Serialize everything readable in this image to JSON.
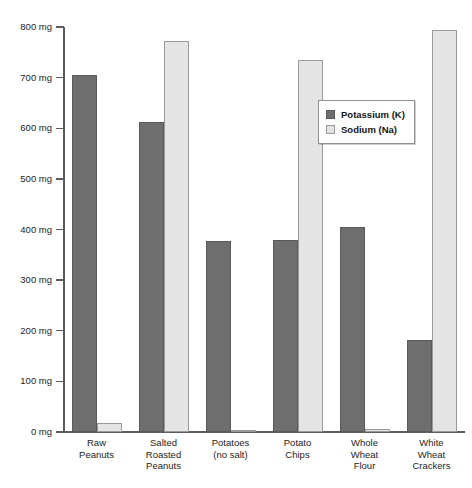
{
  "chart_data": {
    "type": "bar",
    "title": "Potassium and Sodium Content of Selected Foods",
    "xlabel": "",
    "ylabel": "",
    "ylim": [
      0,
      800
    ],
    "y_tick_step": 100,
    "y_unit": "mg",
    "grid": false,
    "legend_position": "inside upper-right",
    "categories": [
      "Raw Peanuts",
      "Salted Roasted Peanuts",
      "Potatoes (no salt)",
      "Potato Chips",
      "Whole Wheat Flour",
      "White Wheat Crackers"
    ],
    "category_label_lines": [
      [
        "Raw",
        "Peanuts"
      ],
      [
        "Salted",
        "Roasted",
        "Peanuts"
      ],
      [
        "Potatoes",
        "(no salt)"
      ],
      [
        "Potato",
        "Chips"
      ],
      [
        "Whole",
        "Wheat",
        "Flour"
      ],
      [
        "White",
        "Wheat",
        "Crackers"
      ]
    ],
    "y_tick_labels": [
      "0 mg",
      "100 mg",
      "200 mg",
      "300 mg",
      "400 mg",
      "500 mg",
      "600 mg",
      "700 mg",
      "800 mg"
    ],
    "y_tick_values": [
      0,
      100,
      200,
      300,
      400,
      500,
      600,
      700,
      800
    ],
    "series": [
      {
        "name": "Potassium (K)",
        "color": "#6e6e6e",
        "values": [
          705,
          612,
          378,
          380,
          405,
          182
        ]
      },
      {
        "name": "Sodium (Na)",
        "color": "#e4e4e4",
        "values": [
          18,
          772,
          2,
          735,
          5,
          795
        ]
      }
    ]
  },
  "legend": {
    "items": [
      {
        "label": "Potassium (K)"
      },
      {
        "label": "Sodium (Na)"
      }
    ]
  }
}
